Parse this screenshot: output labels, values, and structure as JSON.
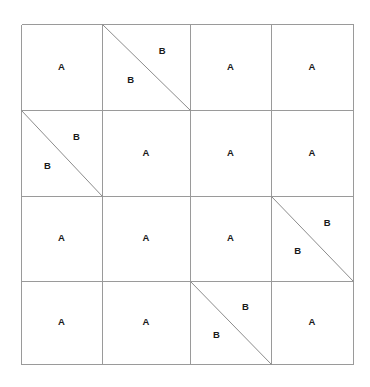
{
  "diagram": {
    "type": "grid-triangulation",
    "title": "",
    "rows": 4,
    "cols": 4,
    "geometry": {
      "x_lines": [
        21,
        102,
        190,
        271,
        353
      ],
      "y_lines": [
        24,
        110,
        196,
        281,
        364
      ],
      "left": 21,
      "top": 24,
      "right": 353,
      "bottom": 364
    },
    "colors": {
      "background": "#ffffff",
      "grid_line": "#9a9a9a",
      "border": "#a8a8a8",
      "diagonal": "#8c8c8c",
      "label_text": "#1a1a1a"
    },
    "labels": {
      "plain": "A",
      "split_upper": "B",
      "split_lower": "B"
    },
    "cells": [
      {
        "row": 1,
        "col": 1,
        "split": false,
        "labels": [
          "A"
        ]
      },
      {
        "row": 1,
        "col": 2,
        "split": true,
        "diagonal": "tl-br",
        "labels": [
          "B",
          "B"
        ]
      },
      {
        "row": 1,
        "col": 3,
        "split": false,
        "labels": [
          "A"
        ]
      },
      {
        "row": 1,
        "col": 4,
        "split": false,
        "labels": [
          "A"
        ]
      },
      {
        "row": 2,
        "col": 1,
        "split": true,
        "diagonal": "tl-br",
        "labels": [
          "B",
          "B"
        ]
      },
      {
        "row": 2,
        "col": 2,
        "split": false,
        "labels": [
          "A"
        ]
      },
      {
        "row": 2,
        "col": 3,
        "split": false,
        "labels": [
          "A"
        ]
      },
      {
        "row": 2,
        "col": 4,
        "split": false,
        "labels": [
          "A"
        ]
      },
      {
        "row": 3,
        "col": 1,
        "split": false,
        "labels": [
          "A"
        ]
      },
      {
        "row": 3,
        "col": 2,
        "split": false,
        "labels": [
          "A"
        ]
      },
      {
        "row": 3,
        "col": 3,
        "split": false,
        "labels": [
          "A"
        ]
      },
      {
        "row": 3,
        "col": 4,
        "split": true,
        "diagonal": "tl-br",
        "labels": [
          "B",
          "B"
        ]
      },
      {
        "row": 4,
        "col": 1,
        "split": false,
        "labels": [
          "A"
        ]
      },
      {
        "row": 4,
        "col": 2,
        "split": false,
        "labels": [
          "A"
        ]
      },
      {
        "row": 4,
        "col": 3,
        "split": true,
        "diagonal": "tl-br",
        "labels": [
          "B",
          "B"
        ]
      },
      {
        "row": 4,
        "col": 4,
        "split": false,
        "labels": [
          "A"
        ]
      }
    ]
  }
}
